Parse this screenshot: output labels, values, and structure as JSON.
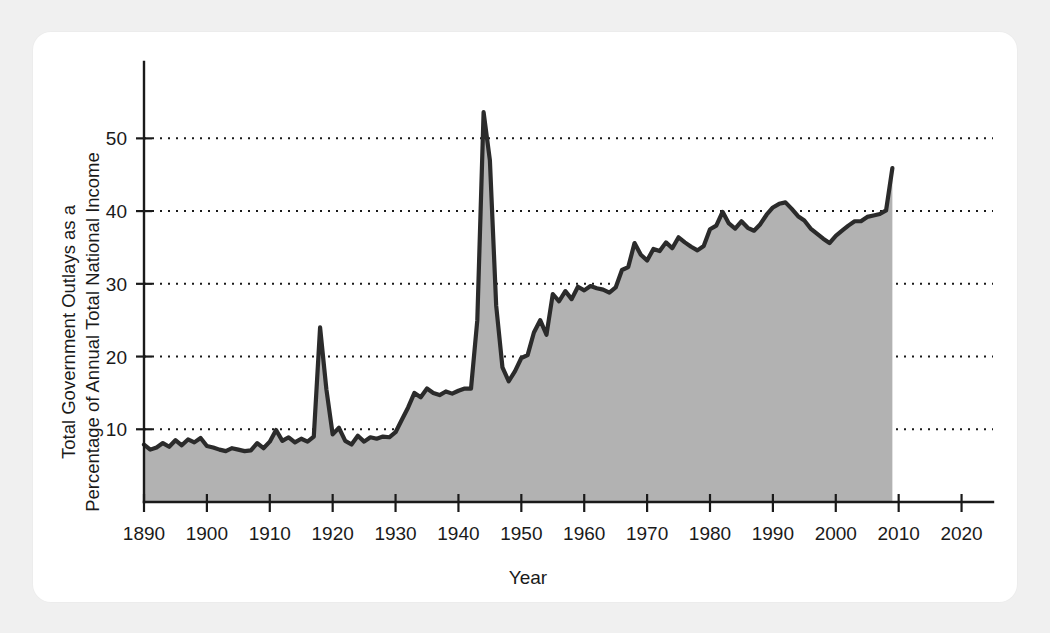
{
  "figure": {
    "background_color": "#f0f0f0",
    "card_color": "#ffffff",
    "line_color": "#2b2b2b",
    "fill_color": "#b2b2b2",
    "text_color": "#1a1a1a"
  },
  "axes": {
    "xlabel": "Year",
    "ylabel_line1": "Total Government Outlays as a",
    "ylabel_line2": "Percentage of Annual Total National Income",
    "x_ticks": [
      "1890",
      "1900",
      "1910",
      "1920",
      "1930",
      "1940",
      "1950",
      "1960",
      "1970",
      "1980",
      "1990",
      "2000",
      "2010",
      "2020"
    ],
    "y_ticks": [
      "10",
      "20",
      "30",
      "40",
      "50"
    ]
  },
  "chart_data": {
    "type": "area",
    "title": "",
    "subtitle": "",
    "xlabel": "Year",
    "ylabel": "Total Government Outlays as a Percentage of Annual Total National Income",
    "xlim": [
      1890,
      2025
    ],
    "ylim": [
      0,
      60.5
    ],
    "xticks": [
      1890,
      1900,
      1910,
      1920,
      1930,
      1940,
      1950,
      1960,
      1970,
      1980,
      1990,
      2000,
      2010,
      2020
    ],
    "yticks": [
      10,
      20,
      30,
      40,
      50
    ],
    "grid": "horizontal-dotted",
    "legend": "none",
    "series": [
      {
        "name": "Total Government Outlays (% of Annual Total National Income)",
        "x": [
          1890,
          1891,
          1892,
          1893,
          1894,
          1895,
          1896,
          1897,
          1898,
          1899,
          1900,
          1901,
          1902,
          1903,
          1904,
          1905,
          1906,
          1907,
          1908,
          1909,
          1910,
          1911,
          1912,
          1913,
          1914,
          1915,
          1916,
          1917,
          1918,
          1919,
          1920,
          1921,
          1922,
          1923,
          1924,
          1925,
          1926,
          1927,
          1928,
          1929,
          1930,
          1931,
          1932,
          1933,
          1934,
          1935,
          1936,
          1937,
          1938,
          1939,
          1940,
          1941,
          1942,
          1943,
          1944,
          1945,
          1946,
          1947,
          1948,
          1949,
          1950,
          1951,
          1952,
          1953,
          1954,
          1955,
          1956,
          1957,
          1958,
          1959,
          1960,
          1961,
          1962,
          1963,
          1964,
          1965,
          1966,
          1967,
          1968,
          1969,
          1970,
          1971,
          1972,
          1973,
          1974,
          1975,
          1976,
          1977,
          1978,
          1979,
          1980,
          1981,
          1982,
          1983,
          1984,
          1985,
          1986,
          1987,
          1988,
          1989,
          1990,
          1991,
          1992,
          1993,
          1994,
          1995,
          1996,
          1997,
          1998,
          1999,
          2000,
          2001,
          2002,
          2003,
          2004,
          2005,
          2006,
          2007,
          2008,
          2009
        ],
        "values": [
          7.9,
          7.2,
          7.5,
          8.1,
          7.6,
          8.5,
          7.8,
          8.6,
          8.2,
          8.8,
          7.7,
          7.5,
          7.2,
          7.0,
          7.4,
          7.2,
          7.0,
          7.1,
          8.1,
          7.4,
          8.3,
          9.9,
          8.4,
          8.9,
          8.2,
          8.7,
          8.3,
          9.0,
          24.0,
          15.5,
          9.3,
          10.2,
          8.4,
          7.9,
          9.1,
          8.3,
          8.9,
          8.7,
          9.0,
          8.9,
          9.6,
          11.3,
          13.0,
          15.0,
          14.4,
          15.6,
          15.0,
          14.7,
          15.2,
          14.9,
          15.3,
          15.6,
          15.6,
          25.0,
          53.6,
          47.0,
          27.0,
          18.5,
          16.6,
          18.0,
          19.8,
          20.2,
          23.3,
          25.0,
          23.0,
          28.6,
          27.6,
          29.0,
          27.9,
          29.6,
          29.1,
          29.7,
          29.4,
          29.2,
          28.8,
          29.5,
          31.9,
          32.3,
          35.6,
          34.0,
          33.2,
          34.8,
          34.5,
          35.7,
          34.9,
          36.4,
          35.7,
          35.1,
          34.6,
          35.2,
          37.5,
          38.0,
          39.9,
          38.3,
          37.6,
          38.6,
          37.7,
          37.3,
          38.2,
          39.5,
          40.5,
          41.0,
          41.2,
          40.3,
          39.3,
          38.7,
          37.6,
          36.9,
          36.2,
          35.6,
          36.6,
          37.3,
          38.0,
          38.6,
          38.6,
          39.2,
          39.4,
          39.6,
          40.1,
          45.9
        ]
      }
    ]
  }
}
